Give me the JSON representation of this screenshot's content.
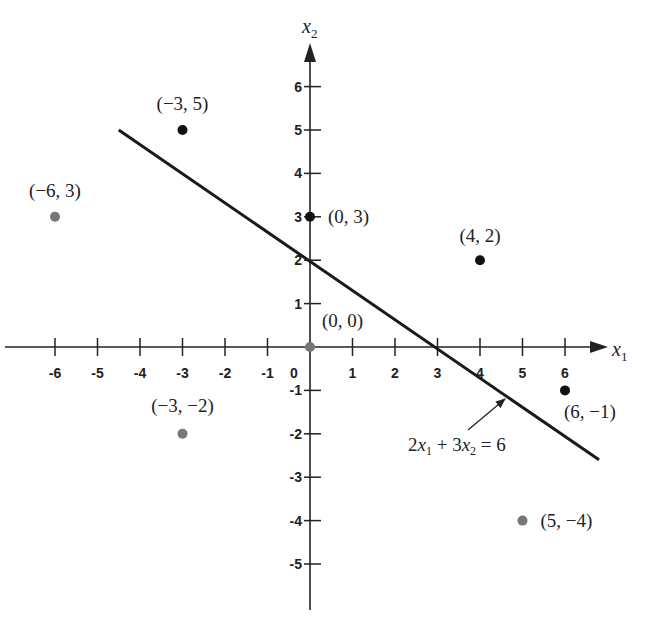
{
  "chart_data": {
    "type": "scatter",
    "title": "",
    "xlabel": "x1",
    "ylabel": "x2",
    "xlim": [
      -6.5,
      7
    ],
    "ylim": [
      -6,
      7
    ],
    "grid": false,
    "x_ticks": [
      -6,
      -5,
      -4,
      -3,
      -2,
      -1,
      0,
      1,
      2,
      3,
      4,
      5,
      6
    ],
    "y_ticks": [
      -5,
      -4,
      -3,
      -2,
      -1,
      1,
      2,
      3,
      4,
      5,
      6
    ],
    "x_tick_labels": [
      "-6",
      "-5",
      "-4",
      "-3",
      "-2",
      "-1",
      "0",
      "1",
      "2",
      "3",
      "4",
      "5",
      "6"
    ],
    "y_tick_labels": [
      "-5",
      "-4",
      "-3",
      "-2",
      "-1",
      "1",
      "2",
      "3",
      "4",
      "5",
      "6"
    ],
    "points": [
      {
        "x": -3,
        "y": 5,
        "label": "(−3, 5)",
        "color": "#111111"
      },
      {
        "x": -6,
        "y": 3,
        "label": "(−6, 3)",
        "color": "#777777"
      },
      {
        "x": 0,
        "y": 3,
        "label": "(0, 3)",
        "color": "#111111"
      },
      {
        "x": 4,
        "y": 2,
        "label": "(4, 2)",
        "color": "#111111"
      },
      {
        "x": 0,
        "y": 0,
        "label": "(0, 0)",
        "color": "#777777"
      },
      {
        "x": 6,
        "y": -1,
        "label": "(6, −1)",
        "color": "#111111"
      },
      {
        "x": -3,
        "y": -2,
        "label": "(−3, −2)",
        "color": "#777777"
      },
      {
        "x": 5,
        "y": -4,
        "label": "(5, −4)",
        "color": "#777777"
      }
    ],
    "line": {
      "equation": "2x1 + 3x2 = 6",
      "label_parts": [
        "2",
        "x",
        "1",
        " + 3",
        "x",
        "2",
        " = 6"
      ],
      "from": {
        "x": -4.5,
        "y": 5.0
      },
      "to": {
        "x": 6.8,
        "y": -2.6
      }
    },
    "annotations": [
      {
        "text": "2x1 + 3x2 = 6",
        "arrow_to": {
          "x": 4.6,
          "y": -1.1
        }
      }
    ]
  },
  "axes": {
    "x_title": "x",
    "x_sub": "1",
    "y_title": "x",
    "y_sub": "2"
  },
  "equation": {
    "c1": "2",
    "v1": "x",
    "s1": "1",
    "mid": " + 3",
    "v2": "x",
    "s2": "2",
    "rhs": " = 6"
  }
}
